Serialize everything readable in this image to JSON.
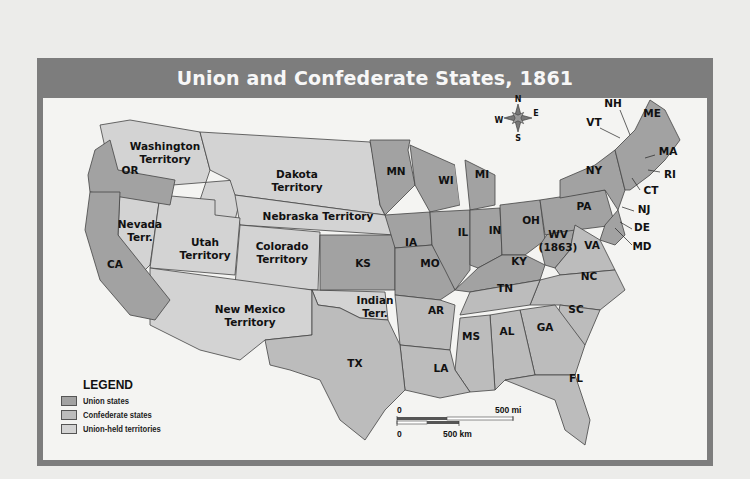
{
  "title": "Union and Confederate States, 1861",
  "legend": {
    "title": "LEGEND",
    "items": [
      {
        "label": "Union states",
        "color": "#a2a2a2"
      },
      {
        "label": "Confederate states",
        "color": "#bcbcbc"
      },
      {
        "label": "Union-held territories",
        "color": "#d3d3d3"
      }
    ]
  },
  "compass": {
    "n": "N",
    "s": "S",
    "e": "E",
    "w": "W"
  },
  "scale": {
    "mi_zero": "0",
    "mi_label": "500 mi",
    "km_zero": "0",
    "km_label": "500 km"
  },
  "regions": {
    "washington": [
      "Washington",
      "Territory"
    ],
    "or": "OR",
    "dakota": [
      "Dakota",
      "Territory"
    ],
    "mn": "MN",
    "wi": "WI",
    "mi": "MI",
    "nevada": [
      "Nevada",
      "Terr."
    ],
    "nebraska": "Nebraska Territory",
    "ia": "IA",
    "il": "IL",
    "in": "IN",
    "oh": "OH",
    "pa": "PA",
    "ny": "NY",
    "vt": "VT",
    "nh": "NH",
    "me": "ME",
    "ma": "MA",
    "ri": "RI",
    "ct": "CT",
    "nj": "NJ",
    "de": "DE",
    "md": "MD",
    "ca": "CA",
    "utah": [
      "Utah",
      "Territory"
    ],
    "colorado": [
      "Colorado",
      "Territory"
    ],
    "ks": "KS",
    "mo": "MO",
    "ky": "KY",
    "wv": [
      "WV",
      "(1863)"
    ],
    "va": "VA",
    "nc": "NC",
    "tn": "TN",
    "sc": "SC",
    "newmexico": [
      "New Mexico",
      "Territory"
    ],
    "indian": [
      "Indian",
      "Terr."
    ],
    "ar": "AR",
    "ms": "MS",
    "al": "AL",
    "ga": "GA",
    "tx": "TX",
    "la": "LA",
    "fl": "FL"
  }
}
